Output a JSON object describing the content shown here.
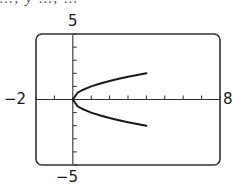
{
  "header": {
    "cropped_text": "…, y …, …"
  },
  "chart_data": {
    "type": "line",
    "title": "",
    "xlabel": "",
    "ylabel": "",
    "xlim": [
      -2,
      8
    ],
    "ylim": [
      -5,
      5
    ],
    "x_tick_step": 1,
    "y_tick_step": 1,
    "grid": false,
    "window_labels": {
      "xmin": "−2",
      "xmax": "8",
      "ymin": "−5",
      "ymax": "5"
    },
    "series": [
      {
        "name": "upper branch y = √x",
        "x": [
          0,
          0.25,
          0.5,
          1,
          1.5,
          2,
          2.5,
          3,
          3.5,
          4
        ],
        "y": [
          0,
          0.5,
          0.707,
          1,
          1.225,
          1.414,
          1.581,
          1.732,
          1.871,
          2
        ]
      },
      {
        "name": "lower branch y = −√x",
        "x": [
          0,
          0.25,
          0.5,
          1,
          1.5,
          2,
          2.5,
          3,
          3.5,
          4
        ],
        "y": [
          0,
          -0.5,
          -0.707,
          -1,
          -1.225,
          -1.414,
          -1.581,
          -1.732,
          -1.871,
          -2
        ]
      }
    ],
    "colors": {
      "curve": "#1a1a1a",
      "axes": "#333333",
      "frame": "#333333"
    }
  }
}
